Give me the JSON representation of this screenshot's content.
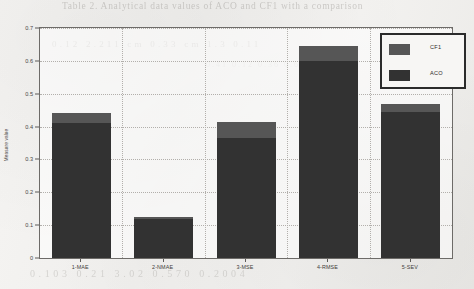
{
  "chart_data": {
    "type": "bar",
    "subtype": "stacked-bar",
    "title": "",
    "xlabel": "",
    "ylabel": "Measure value",
    "ylim": [
      0,
      0.7
    ],
    "ytick_values": [
      0,
      0.1,
      0.2,
      0.3,
      0.4,
      0.5,
      0.6,
      0.7
    ],
    "ytick_labels": [
      "0",
      "0.1",
      "0.2",
      "0.3",
      "0.4",
      "0.5",
      "0.6",
      "0.7"
    ],
    "grid": true,
    "grid_style": "dotted",
    "legend_position": "top-right",
    "categories": [
      "1-MAE",
      "2-NMAE",
      "3-MSE",
      "4-RMSE",
      "5-SEV"
    ],
    "series": [
      {
        "name": "ACO",
        "color": "#323232",
        "stack_position": "bottom",
        "values": [
          0.41,
          0.12,
          0.365,
          0.6,
          0.445
        ]
      },
      {
        "name": "CF1",
        "color": "#565656",
        "stack_position": "top",
        "values": [
          0.03,
          0.005,
          0.05,
          0.045,
          0.025
        ]
      }
    ],
    "cumulative_tops": [
      0.44,
      0.125,
      0.415,
      0.645,
      0.47
    ]
  },
  "legend": {
    "entries": [
      {
        "label": "CF1",
        "color": "#565656",
        "swatch_name": "legend-swatch-cf1"
      },
      {
        "label": "ACO",
        "color": "#323232",
        "swatch_name": "legend-swatch-aco"
      }
    ]
  },
  "axes": {
    "y_title": "Measure value",
    "y_labels": [
      "0.7",
      "0.6",
      "0.5",
      "0.4",
      "0.3",
      "0.2",
      "0.1",
      "0"
    ],
    "x_labels": [
      "1-MAE",
      "2-NMAE",
      "3-MSE",
      "4-RMSE",
      "5-SEV"
    ]
  },
  "scan_artifacts": {
    "caption_ghost": "Table 2. Analytical data values of ACO and CF1 with a comparison",
    "row_ghost_1": "0.12   2.211 cm   0.33 cm   1.3   0.11",
    "row_ghost_2": "0.103    0.21    3.02    0.570    0.2004",
    "row_ghost_3": "0.41 0.12 0.36 0.60"
  }
}
